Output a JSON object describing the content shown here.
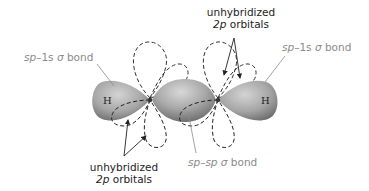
{
  "figure": {
    "colors": {
      "lobe_fill_light": "#c9c9c9",
      "lobe_fill_dark": "#7d7d7d",
      "dashed_orbital": "#333333",
      "label_gray": "#8a8a8a",
      "label_dark": "#222222",
      "leader_line": "#8a8a8a"
    },
    "atoms": [
      {
        "symbol": "H",
        "position": "left"
      },
      {
        "symbol": "C",
        "position": "center-left"
      },
      {
        "symbol": "C",
        "position": "center-right"
      },
      {
        "symbol": "H",
        "position": "right"
      }
    ],
    "labels": {
      "left_sigma": {
        "prefix": "sp",
        "dash": "–",
        "mid": "1s",
        "sigma": " σ",
        "suffix": " bond"
      },
      "right_sigma": {
        "prefix": "sp",
        "dash": "–",
        "mid": "1s",
        "sigma": " σ",
        "suffix": " bond"
      },
      "center_sigma": {
        "prefix": "sp",
        "dash": "–",
        "mid": "sp",
        "sigma": " σ",
        "suffix": " bond"
      },
      "top_p": {
        "line1": "unhybridized",
        "line2_italic": "2p",
        "line2_rest": " orbitals"
      },
      "bottom_p": {
        "line1": "unhybridized",
        "line2_italic": "2p",
        "line2_rest": " orbitals"
      }
    },
    "atom_labels": {
      "h_left": "H",
      "h_right": "H"
    }
  }
}
